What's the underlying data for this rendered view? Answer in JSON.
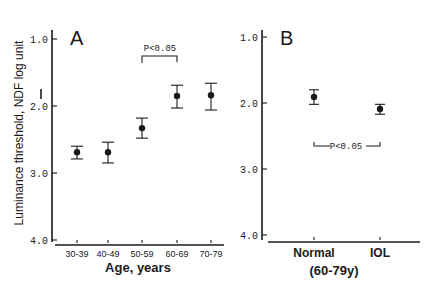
{
  "figure": {
    "ylabel": "Luminance threshold, NDF log unit",
    "ink_color": "#1a1a1a",
    "background": "#ffffff"
  },
  "chart_data": [
    {
      "type": "scatter",
      "panel": "A",
      "title": "A",
      "xlabel": "Age, years",
      "ylabel": "Luminance threshold, NDF log unit",
      "y_inverted": true,
      "ylim": [
        1.0,
        4.0
      ],
      "yticks": [
        "1.0",
        "2.0",
        "3.0",
        "4.0"
      ],
      "categories": [
        "30-39",
        "40-49",
        "50-59",
        "60-69",
        "70-79"
      ],
      "values": [
        2.69,
        2.69,
        2.33,
        1.85,
        1.84
      ],
      "error_low": [
        2.6,
        2.54,
        2.18,
        1.69,
        1.66
      ],
      "error_high": [
        2.79,
        2.85,
        2.48,
        2.03,
        2.06
      ],
      "grid": false,
      "annotations": [
        {
          "text": "P<0.05",
          "between": [
            "50-59",
            "60-69"
          ],
          "type": "bracket-top"
        }
      ]
    },
    {
      "type": "scatter",
      "panel": "B",
      "title": "B",
      "xlabel": "(60-79y)",
      "ylabel": "Luminance threshold, NDF log unit",
      "y_inverted": true,
      "ylim": [
        1.0,
        4.0
      ],
      "yticks": [
        "1.0",
        "2.0",
        "3.0",
        "4.0"
      ],
      "categories": [
        "Normal",
        "IOL"
      ],
      "values": [
        1.91,
        2.09
      ],
      "error_low": [
        1.8,
        2.02
      ],
      "error_high": [
        2.02,
        2.17
      ],
      "grid": false,
      "annotations": [
        {
          "text": "P<0.05",
          "between": [
            "Normal",
            "IOL"
          ],
          "type": "bracket-bottom"
        }
      ]
    }
  ]
}
